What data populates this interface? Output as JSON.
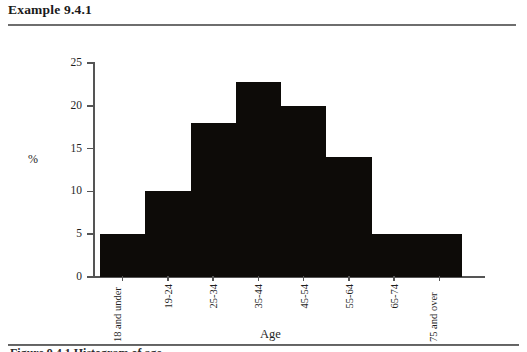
{
  "header": {
    "example_label": "Example 9.4.1"
  },
  "footer": {
    "caption": "Figure 9.4.1  Histogram of age"
  },
  "chart_data": {
    "type": "bar",
    "title": "",
    "xlabel": "Age",
    "ylabel": "%",
    "categories": [
      "18 and under",
      "19-24",
      "25-34",
      "35-44",
      "45-54",
      "55-64",
      "65-74",
      "75 and over"
    ],
    "values": [
      5,
      10,
      18,
      22.8,
      20,
      14,
      5,
      5
    ],
    "ylim": [
      0,
      25
    ],
    "ytick_labels": [
      "0",
      "5",
      "10",
      "15",
      "20",
      "25"
    ],
    "ytick_values": [
      0,
      5,
      10,
      15,
      20,
      25
    ],
    "grid": false,
    "legend": false,
    "bar_color": "#0d0b08",
    "axis_color": "#555555"
  }
}
